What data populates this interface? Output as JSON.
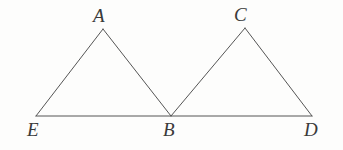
{
  "figure": {
    "kind": "geometry-diagram",
    "background_color": "#fdfdfc",
    "stroke_color": "#555555",
    "label_color": "#3a3a3a",
    "stroke_width": 1,
    "width": 343,
    "height": 150,
    "vertices": [
      {
        "id": "A",
        "label": "A",
        "x": 103,
        "y": 29,
        "label_x": 93,
        "label_y": 6,
        "role": "apex-left-triangle"
      },
      {
        "id": "C",
        "label": "C",
        "x": 245,
        "y": 28,
        "label_x": 234,
        "label_y": 5,
        "role": "apex-right-triangle"
      },
      {
        "id": "E",
        "label": "E",
        "x": 36,
        "y": 116,
        "label_x": 27,
        "label_y": 120,
        "role": "baseline-left-end"
      },
      {
        "id": "B",
        "label": "B",
        "x": 171,
        "y": 116,
        "label_x": 163,
        "label_y": 120,
        "role": "baseline-shared-vertex"
      },
      {
        "id": "D",
        "label": "D",
        "x": 312,
        "y": 116,
        "label_x": 304,
        "label_y": 120,
        "role": "baseline-right-end"
      }
    ],
    "segments": [
      {
        "id": "EA",
        "from": "E",
        "to": "A",
        "x1": 36,
        "y1": 116,
        "x2": 103,
        "y2": 29
      },
      {
        "id": "AB",
        "from": "A",
        "to": "B",
        "x1": 103,
        "y1": 29,
        "x2": 171,
        "y2": 116
      },
      {
        "id": "BC",
        "from": "B",
        "to": "C",
        "x1": 171,
        "y1": 116,
        "x2": 245,
        "y2": 28
      },
      {
        "id": "CD",
        "from": "C",
        "to": "D",
        "x1": 245,
        "y1": 28,
        "x2": 312,
        "y2": 116
      },
      {
        "id": "ED",
        "from": "E",
        "to": "D",
        "x1": 36,
        "y1": 116,
        "x2": 312,
        "y2": 116
      }
    ],
    "triangles": [
      {
        "id": "AEB",
        "vertices": [
          "A",
          "E",
          "B"
        ]
      },
      {
        "id": "CBD",
        "vertices": [
          "C",
          "B",
          "D"
        ]
      }
    ]
  }
}
